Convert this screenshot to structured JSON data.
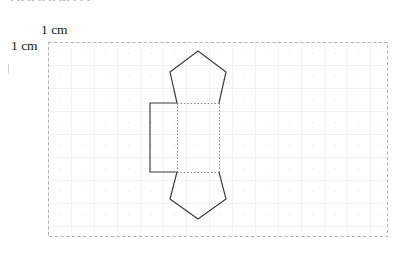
{
  "page": {
    "width": 406,
    "height": 261,
    "background": "#ffffff"
  },
  "cropped_header": {
    "text": "ı ıı ıı ıı ıı ııı ı  ı  ı",
    "color": "#9a9a9a"
  },
  "labels": {
    "top_scale": "1 cm",
    "left_scale": "1 cm",
    "color": "#1a1a1a"
  },
  "grid": {
    "border_label": "grid-outer-border",
    "border_color": "#b0b0b0",
    "border_style": "dashed",
    "line_color": "#e2e2e2",
    "dot_color": "#cfcfcf",
    "cell_size_px": 23,
    "origin_x": 48,
    "origin_y": 42,
    "width_px": 340,
    "height_px": 195,
    "cols": 15,
    "rows": 9
  },
  "figure": {
    "name": "pentagonal-prism-net",
    "stroke_color": "#3a3a3a",
    "fold_line_color": "#8a8a8a",
    "fold_line_style": "dotted",
    "parts": [
      {
        "name": "top-pentagon",
        "shape": "pentagon",
        "orientation": "apex-up",
        "points": "198,51 226,72 219,103 177,103 170,72"
      },
      {
        "name": "bottom-pentagon",
        "shape": "pentagon",
        "orientation": "apex-down",
        "points": "177,172 219,172 226,199 198,219 170,199"
      },
      {
        "name": "left-rectangle-face",
        "shape": "rectangle",
        "open_edge": "right",
        "points": "177,103 150,103 150,172 177,172"
      },
      {
        "name": "middle-rectangle-face",
        "shape": "rectangle",
        "points": "177,103 219,103 219,172 177,172"
      }
    ],
    "fold_lines": [
      {
        "name": "fold-top",
        "x1": 177,
        "y1": 103,
        "x2": 219,
        "y2": 103
      },
      {
        "name": "fold-bottom",
        "x1": 177,
        "y1": 172,
        "x2": 219,
        "y2": 172
      },
      {
        "name": "fold-left-vertical",
        "x1": 177,
        "y1": 103,
        "x2": 177,
        "y2": 172
      },
      {
        "name": "fold-right-vertical",
        "x1": 219,
        "y1": 103,
        "x2": 219,
        "y2": 172
      }
    ],
    "solid_edges": [
      {
        "name": "pentagon-top-left-upper",
        "x1": 198,
        "y1": 51,
        "x2": 170,
        "y2": 72
      },
      {
        "name": "pentagon-top-right-upper",
        "x1": 198,
        "y1": 51,
        "x2": 226,
        "y2": 72
      },
      {
        "name": "pentagon-top-left-lower",
        "x1": 170,
        "y1": 72,
        "x2": 177,
        "y2": 103
      },
      {
        "name": "pentagon-top-right-lower",
        "x1": 226,
        "y1": 72,
        "x2": 219,
        "y2": 103
      },
      {
        "name": "rect-top",
        "x1": 177,
        "y1": 103,
        "x2": 150,
        "y2": 103
      },
      {
        "name": "rect-left",
        "x1": 150,
        "y1": 103,
        "x2": 150,
        "y2": 172
      },
      {
        "name": "rect-bottom",
        "x1": 150,
        "y1": 172,
        "x2": 177,
        "y2": 172
      },
      {
        "name": "pentagon-bottom-left-upper",
        "x1": 177,
        "y1": 172,
        "x2": 170,
        "y2": 199
      },
      {
        "name": "pentagon-bottom-right-upper",
        "x1": 219,
        "y1": 172,
        "x2": 226,
        "y2": 199
      },
      {
        "name": "pentagon-bottom-left-lower",
        "x1": 170,
        "y1": 199,
        "x2": 198,
        "y2": 219
      },
      {
        "name": "pentagon-bottom-right-lower",
        "x1": 226,
        "y1": 199,
        "x2": 198,
        "y2": 219
      }
    ]
  }
}
